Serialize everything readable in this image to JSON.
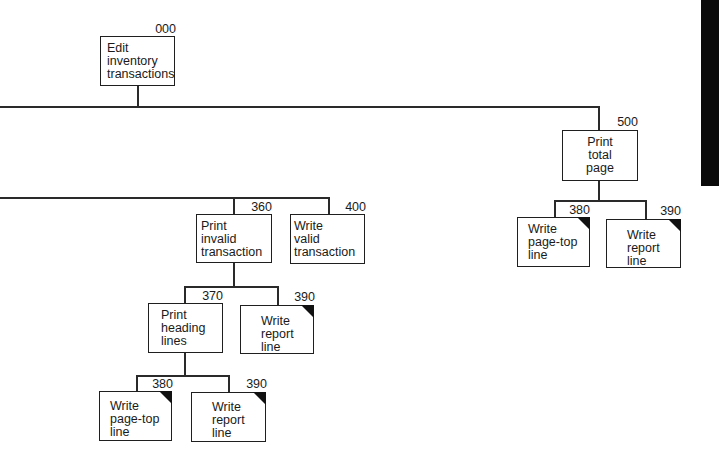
{
  "diagram": {
    "type": "structure-chart",
    "nodes": [
      {
        "id": "000",
        "number": "000",
        "lines": [
          "Edit",
          "inventory",
          "transactions"
        ],
        "reused": false
      },
      {
        "id": "500",
        "number": "500",
        "lines": [
          "Print",
          "total",
          "page"
        ],
        "reused": false
      },
      {
        "id": "380a",
        "number": "380",
        "lines": [
          "Write",
          "page-top",
          "line"
        ],
        "reused": true
      },
      {
        "id": "390a",
        "number": "390",
        "lines": [
          "Write",
          "report",
          "line"
        ],
        "reused": true
      },
      {
        "id": "360",
        "number": "360",
        "lines": [
          "Print",
          "invalid",
          "transaction"
        ],
        "reused": false
      },
      {
        "id": "400",
        "number": "400",
        "lines": [
          "Write",
          "valid",
          "transaction"
        ],
        "reused": false
      },
      {
        "id": "370",
        "number": "370",
        "lines": [
          "Print",
          "heading",
          "lines"
        ],
        "reused": false
      },
      {
        "id": "390b",
        "number": "390",
        "lines": [
          "Write",
          "report",
          "line"
        ],
        "reused": true
      },
      {
        "id": "380b",
        "number": "380",
        "lines": [
          "Write",
          "page-top",
          "line"
        ],
        "reused": true
      },
      {
        "id": "390c",
        "number": "390",
        "lines": [
          "Write",
          "report",
          "line"
        ],
        "reused": true
      }
    ],
    "edges": [
      [
        "000",
        "500"
      ],
      [
        "500",
        "380a"
      ],
      [
        "500",
        "390a"
      ],
      [
        "360",
        "370"
      ],
      [
        "360",
        "390b"
      ],
      [
        "370",
        "380b"
      ],
      [
        "370",
        "390c"
      ]
    ]
  }
}
